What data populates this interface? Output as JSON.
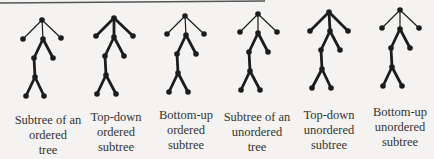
{
  "figure": {
    "background": "#f4f3f1",
    "top_rule": {
      "x1": 0,
      "y1": 3,
      "x2": 265,
      "y2": 1,
      "color": "#555555"
    },
    "stroke_color": "#1c1c1c",
    "thin_width": 1.2,
    "thick_width": 2.8,
    "node_radius": 2.8,
    "trees": [
      {
        "id": "subtree-ordered-tree",
        "caption": [
          "Subtree of an",
          "ordered",
          "tree"
        ],
        "caption_pos": {
          "x": 8,
          "y": 113
        },
        "top_style": "thin",
        "nodes": {
          "root": [
            42,
            20
          ],
          "L": [
            23,
            39
          ],
          "M": [
            43,
            39
          ],
          "R": [
            61,
            38
          ],
          "A": [
            34,
            58
          ],
          "B": [
            53,
            58
          ],
          "C": [
            35,
            77
          ],
          "D": [
            26,
            96
          ],
          "E": [
            44,
            96
          ]
        }
      },
      {
        "id": "top-down-ordered-subtree",
        "caption": [
          "Top-down",
          "ordered",
          "subtree"
        ],
        "caption_pos": {
          "x": 76,
          "y": 110
        },
        "top_style": "thick",
        "nodes": {
          "root": [
            114,
            18
          ],
          "L": [
            96,
            36
          ],
          "M": [
            114,
            37
          ],
          "R": [
            133,
            36
          ],
          "A": [
            105,
            56
          ],
          "B": [
            124,
            56
          ],
          "C": [
            106,
            75
          ],
          "D": [
            97,
            94
          ],
          "E": [
            116,
            94
          ]
        }
      },
      {
        "id": "bottom-up-ordered-subtree",
        "caption": [
          "Bottom-up",
          "ordered",
          "subtree"
        ],
        "caption_pos": {
          "x": 146,
          "y": 108
        },
        "top_style": "thin",
        "nodes": {
          "root": [
            185,
            16
          ],
          "L": [
            167,
            34
          ],
          "M": [
            186,
            35
          ],
          "R": [
            204,
            34
          ],
          "A": [
            177,
            54
          ],
          "B": [
            196,
            54
          ],
          "C": [
            178,
            73
          ],
          "D": [
            169,
            92
          ],
          "E": [
            188,
            92
          ]
        }
      },
      {
        "id": "subtree-unordered-tree",
        "caption": [
          "Subtree of an",
          "unordered",
          "tree"
        ],
        "caption_pos": {
          "x": 217,
          "y": 110
        },
        "top_style": "thin",
        "nodes": {
          "root": [
            258,
            14
          ],
          "L": [
            240,
            32
          ],
          "M": [
            258,
            33
          ],
          "R": [
            277,
            32
          ],
          "A": [
            249,
            52
          ],
          "B": [
            268,
            52
          ],
          "C": [
            250,
            71
          ],
          "D": [
            241,
            90
          ],
          "E": [
            260,
            90
          ]
        }
      },
      {
        "id": "top-down-unordered-subtree",
        "caption": [
          "Top-down",
          "unordered",
          "subtree"
        ],
        "caption_pos": {
          "x": 289,
          "y": 108
        },
        "top_style": "thick",
        "nodes": {
          "root": [
            329,
            12
          ],
          "L": [
            310,
            31
          ],
          "M": [
            330,
            31
          ],
          "R": [
            348,
            31
          ],
          "A": [
            321,
            50
          ],
          "B": [
            340,
            50
          ],
          "C": [
            322,
            69
          ],
          "D": [
            312,
            88
          ],
          "E": [
            331,
            88
          ]
        }
      },
      {
        "id": "bottom-up-unordered-subtree",
        "caption": [
          "Bottom-up",
          "unordered",
          "subtree"
        ],
        "caption_pos": {
          "x": 360,
          "y": 105
        },
        "top_style": "thin",
        "nodes": {
          "root": [
            400,
            10
          ],
          "L": [
            382,
            28
          ],
          "M": [
            400,
            29
          ],
          "R": [
            419,
            28
          ],
          "A": [
            391,
            48
          ],
          "B": [
            410,
            48
          ],
          "C": [
            392,
            67
          ],
          "D": [
            383,
            86
          ],
          "E": [
            402,
            86
          ]
        }
      }
    ],
    "edges": {
      "top": [
        [
          "root",
          "L"
        ],
        [
          "root",
          "M"
        ],
        [
          "root",
          "R"
        ]
      ],
      "bottom": [
        [
          "M",
          "A"
        ],
        [
          "M",
          "B"
        ],
        [
          "A",
          "C"
        ],
        [
          "C",
          "D"
        ],
        [
          "C",
          "E"
        ]
      ]
    }
  }
}
